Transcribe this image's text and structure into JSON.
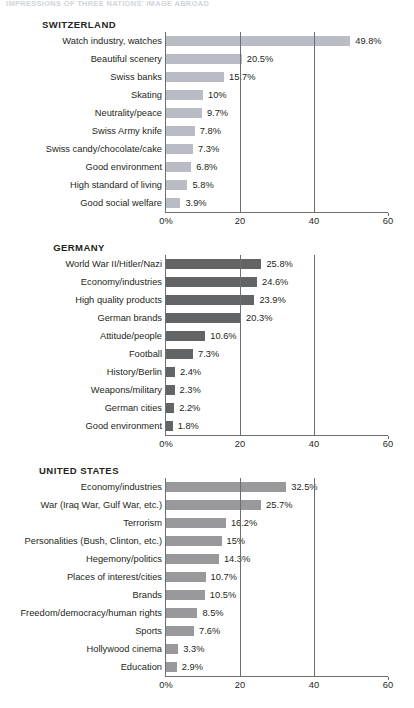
{
  "running_head": "IMPRESSIONS OF THREE NATIONS' IMAGE ABROAD",
  "axis": {
    "min": 0,
    "max": 60,
    "ticks": [
      {
        "value": 0,
        "label": "0%"
      },
      {
        "value": 20,
        "label": "20"
      },
      {
        "value": 40,
        "label": "40"
      },
      {
        "value": 60,
        "label": "60"
      }
    ],
    "gridlines": [
      20,
      40
    ]
  },
  "colors": {
    "switzerland_bar": "#b9bcc4",
    "germany_bar": "#636466",
    "united_states_bar": "#99999b",
    "axis": "#6d6e71",
    "text": "#231f20"
  },
  "chart_data": [
    {
      "type": "bar",
      "title": "SWITZERLAND",
      "xlabel": "",
      "ylabel": "",
      "xlim": [
        0,
        60
      ],
      "grid": true,
      "orientation": "horizontal",
      "bar_color": "#b9bcc4",
      "categories": [
        "Watch industry, watches",
        "Beautiful scenery",
        "Swiss banks",
        "Skating",
        "Neutrality/peace",
        "Swiss Army knife",
        "Swiss candy/chocolate/cake",
        "Good environment",
        "High standard of living",
        "Good social welfare"
      ],
      "values": [
        49.8,
        20.5,
        15.7,
        10,
        9.7,
        7.8,
        7.3,
        6.8,
        5.8,
        3.9
      ],
      "value_labels": [
        "49.8%",
        "20.5%",
        "15.7%",
        "10%",
        "9.7%",
        "7.8%",
        "7.3%",
        "6.8%",
        "5.8%",
        "3.9%"
      ]
    },
    {
      "type": "bar",
      "title": "GERMANY",
      "xlabel": "",
      "ylabel": "",
      "xlim": [
        0,
        60
      ],
      "grid": true,
      "orientation": "horizontal",
      "bar_color": "#636466",
      "categories": [
        "World War II/Hitler/Nazi",
        "Economy/industries",
        "High quality products",
        "German brands",
        "Attitude/people",
        "Football",
        "History/Berlin",
        "Weapons/military",
        "German cities",
        "Good environment"
      ],
      "values": [
        25.8,
        24.6,
        23.9,
        20.3,
        10.6,
        7.3,
        2.4,
        2.3,
        2.2,
        1.8
      ],
      "value_labels": [
        "25.8%",
        "24.6%",
        "23.9%",
        "20.3%",
        "10.6%",
        "7.3%",
        "2.4%",
        "2.3%",
        "2.2%",
        "1.8%"
      ]
    },
    {
      "type": "bar",
      "title": "UNITED STATES",
      "xlabel": "",
      "ylabel": "",
      "xlim": [
        0,
        60
      ],
      "grid": true,
      "orientation": "horizontal",
      "bar_color": "#99999b",
      "categories": [
        "Economy/industries",
        "War (Iraq War, Gulf War, etc.)",
        "Terrorism",
        "Personalities (Bush, Clinton, etc.)",
        "Hegemony/politics",
        "Places of interest/cities",
        "Brands",
        "Freedom/democracy/human rights",
        "Sports",
        "Hollywood cinema",
        "Education"
      ],
      "values": [
        32.5,
        25.7,
        16.2,
        15,
        14.3,
        10.7,
        10.5,
        8.5,
        7.6,
        3.3,
        2.9
      ],
      "value_labels": [
        "32.5%",
        "25.7%",
        "16.2%",
        "15%",
        "14.3%",
        "10.7%",
        "10.5%",
        "8.5%",
        "7.6%",
        "3.3%",
        "2.9%"
      ]
    }
  ]
}
